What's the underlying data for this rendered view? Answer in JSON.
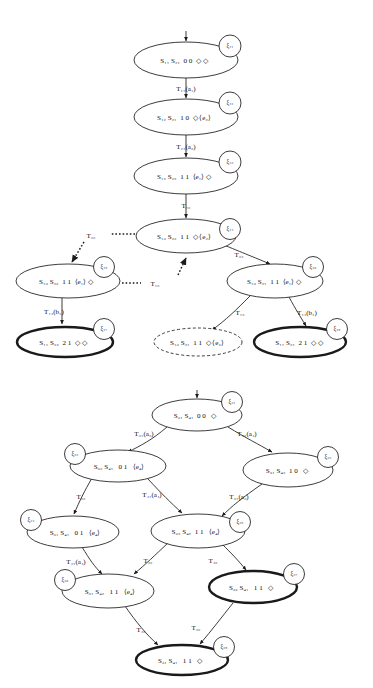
{
  "figure": {
    "diagrams": [
      {
        "id": "upper-tree",
        "nodes": [
          {
            "id": "x11",
            "label": "S₁₁ S₂₁  0 0  ◇ ◇",
            "xi": "ξ₁₁",
            "style": "normal",
            "cx": 186,
            "cy": 60,
            "rx": 52,
            "ry": 18,
            "xi_dx": 44,
            "xi_dy": -14
          },
          {
            "id": "x12",
            "label": "S₁₂ S₂₁  1 0  ◇ ⟨e₂⟩",
            "xi": "ξ₁₂",
            "style": "normal",
            "cx": 186,
            "cy": 117,
            "rx": 52,
            "ry": 18,
            "xi_dx": 44,
            "xi_dy": -14
          },
          {
            "id": "x13",
            "label": "S₁₂ S₂₂  1 1  ⟨e₁⟩ ◇",
            "xi": "ξ₁₃",
            "style": "normal",
            "cx": 186,
            "cy": 176,
            "rx": 52,
            "ry": 18,
            "xi_dx": 44,
            "xi_dy": -14
          },
          {
            "id": "x14",
            "label": "S₁₃ S₂₂  1 1  ◇ ⟨e₂⟩",
            "xi": "ξ₁₄",
            "style": "normal",
            "cx": 186,
            "cy": 236,
            "rx": 50,
            "ry": 17,
            "xi_dx": 44,
            "xi_dy": -8
          },
          {
            "id": "x15",
            "label": "S₁₃ S₂₂  1 1  ⟨e₁⟩ ◇",
            "xi": "ξ₁₅",
            "style": "normal",
            "cx": 68,
            "cy": 281,
            "rx": 52,
            "ry": 17,
            "xi_dx": 44,
            "xi_dy": -14
          },
          {
            "id": "x16",
            "label": "S₁₃ S₂₁  1 1  ⟨e₁⟩ ◇",
            "xi": "ξ₁₆",
            "style": "normal",
            "cx": 275,
            "cy": 281,
            "rx": 48,
            "ry": 17,
            "xi_dx": 42,
            "xi_dy": -14
          },
          {
            "id": "x17",
            "label": "S₁₁ S₂₂  2 1  ◇ ◇",
            "xi": "ξ₁₇",
            "style": "bold",
            "cx": 65,
            "cy": 342,
            "rx": 48,
            "ry": 15,
            "xi_dx": 42,
            "xi_dy": -13
          },
          {
            "id": "xd1",
            "label": "S₁₃ S₂₁  1 1  ◇ ⟨e₂⟩",
            "xi": "",
            "style": "dashed",
            "cx": 198,
            "cy": 342,
            "rx": 44,
            "ry": 14,
            "xi_dx": 0,
            "xi_dy": 0
          },
          {
            "id": "x18",
            "label": "S₁₁ S₂₁  2 1  ◇ ◇",
            "xi": "ξ₁₈",
            "style": "bold",
            "cx": 300,
            "cy": 342,
            "rx": 46,
            "ry": 15,
            "xi_dx": 42,
            "xi_dy": -13
          }
        ],
        "edges": [
          {
            "id": "e-entry",
            "label": "",
            "style": "solid"
          },
          {
            "id": "e-11-12",
            "label": "T₁₁(a₁)",
            "style": "solid",
            "lx": 186,
            "ly": 89
          },
          {
            "id": "e-12-13",
            "label": "T₂₁(a₂)",
            "style": "solid",
            "lx": 186,
            "ly": 147
          },
          {
            "id": "e-13-14",
            "label": "T₁₂",
            "style": "solid",
            "lx": 186,
            "ly": 206
          },
          {
            "id": "e-14-15",
            "label": "T₂₂",
            "style": "dotted",
            "lx": 91,
            "ly": 238
          },
          {
            "id": "e-15-14",
            "label": "T₁₃",
            "style": "dotted",
            "lx": 155,
            "ly": 284
          },
          {
            "id": "e-14-16",
            "label": "T₂₃",
            "style": "solid",
            "lx": 237,
            "ly": 256
          },
          {
            "id": "e-15-17",
            "label": "T₁₄(b₁)",
            "style": "solid",
            "lx": 55,
            "ly": 312
          },
          {
            "id": "e-16-d1",
            "label": "T₁₃",
            "style": "solid",
            "lx": 240,
            "ly": 313
          },
          {
            "id": "e-16-18",
            "label": "T₁₄(b₁)",
            "style": "solid",
            "lx": 305,
            "ly": 313
          }
        ]
      },
      {
        "id": "lower-tree",
        "nodes": [
          {
            "id": "x21",
            "label": "S₃₁ S₄₁  0 0   ◇",
            "xi": "ξ₂₁",
            "style": "normal",
            "cx": 197,
            "cy": 415,
            "rx": 45,
            "ry": 16,
            "xi_dx": 40,
            "xi_dy": -13
          },
          {
            "id": "x22",
            "label": "S₃₂ S₄₁   0 1   ⟨e₄⟩",
            "xi": "ξ₂₂",
            "style": "normal",
            "cx": 118,
            "cy": 466,
            "rx": 48,
            "ry": 16,
            "xi_dx": -43,
            "xi_dy": -12
          },
          {
            "id": "x23",
            "label": "S₃₁ S₄₂  1 0   ◇",
            "xi": "ξ₂₃",
            "style": "normal",
            "cx": 288,
            "cy": 470,
            "rx": 45,
            "ry": 17,
            "xi_dx": 40,
            "xi_dy": -13
          },
          {
            "id": "x24",
            "label": "S₃₁ S₄₁   0 1   ⟨e₄⟩",
            "xi": "ξ₂₄",
            "style": "normal",
            "cx": 73,
            "cy": 532,
            "rx": 46,
            "ry": 16,
            "xi_dx": -42,
            "xi_dy": -12
          },
          {
            "id": "x25",
            "label": "S₃₂ S₄₂  1 1   ⟨e₄⟩",
            "xi": "ξ₂₅",
            "style": "normal",
            "cx": 198,
            "cy": 531,
            "rx": 47,
            "ry": 17,
            "xi_dx": 42,
            "xi_dy": -9
          },
          {
            "id": "x26",
            "label": "S₃₁ S₄₂   1 1   ⟨e₄⟩",
            "xi": "ξ₂₆",
            "style": "normal",
            "cx": 108,
            "cy": 591,
            "rx": 46,
            "ry": 17,
            "xi_dx": -43,
            "xi_dy": -11
          },
          {
            "id": "x27",
            "label": "S₃₂ S₄₁   1 1   ◇",
            "xi": "ξ₂₇",
            "style": "bold",
            "cx": 253,
            "cy": 587,
            "rx": 44,
            "ry": 16,
            "xi_dx": 41,
            "xi_dy": -13
          },
          {
            "id": "x28",
            "label": "S₃₁ S₄₁   1 1   ◇",
            "xi": "ξ₂₈",
            "style": "bold",
            "cx": 182,
            "cy": 660,
            "rx": 46,
            "ry": 15,
            "xi_dx": 42,
            "xi_dy": -13
          }
        ],
        "edges": [
          {
            "id": "e2-entry",
            "label": "",
            "style": "solid"
          },
          {
            "id": "e-21-22",
            "label": "T₃₁(a₃)",
            "style": "solid",
            "lx": 143,
            "ly": 434
          },
          {
            "id": "e-21-23",
            "label": "T₄₁(a₄)",
            "style": "solid",
            "lx": 246,
            "ly": 434
          },
          {
            "id": "e-22-24",
            "label": "T₃₂",
            "style": "solid",
            "lx": 81,
            "ly": 497
          },
          {
            "id": "e-22-25",
            "label": "T₄₁(a₄)",
            "style": "solid",
            "lx": 152,
            "ly": 495
          },
          {
            "id": "e-23-25",
            "label": "T₃₁(a₃)",
            "style": "solid",
            "lx": 238,
            "ly": 497
          },
          {
            "id": "e-24-26",
            "label": "T₄₁(a₄)",
            "style": "solid",
            "lx": 76,
            "ly": 562
          },
          {
            "id": "e-25-26",
            "label": "T₃₂",
            "style": "solid",
            "lx": 148,
            "ly": 561
          },
          {
            "id": "e-25-27",
            "label": "T₄₂",
            "style": "solid",
            "lx": 212,
            "ly": 561
          },
          {
            "id": "e-26-28",
            "label": "T₄₂",
            "style": "solid",
            "lx": 140,
            "ly": 630
          },
          {
            "id": "e-27-28",
            "label": "T₃₂",
            "style": "solid",
            "lx": 196,
            "ly": 628
          }
        ]
      }
    ]
  }
}
